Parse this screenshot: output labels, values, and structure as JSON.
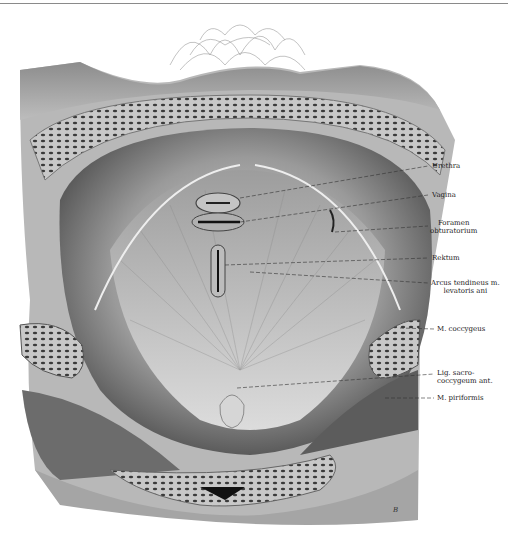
{
  "figure": {
    "labels": [
      {
        "id": "urethra",
        "lines": [
          "Urethra"
        ],
        "x": 432,
        "y": 162
      },
      {
        "id": "vagina",
        "lines": [
          "Vagina"
        ],
        "x": 432,
        "y": 191
      },
      {
        "id": "foramen-obturatorium",
        "lines": [
          "Foramen",
          "obturatorium"
        ],
        "x": 432,
        "y": 219
      },
      {
        "id": "rektum",
        "lines": [
          "Rektum"
        ],
        "x": 432,
        "y": 254
      },
      {
        "id": "arcus-tendineus",
        "lines": [
          "Arcus tendineus m.",
          "levatoris ani"
        ],
        "x": 432,
        "y": 279
      },
      {
        "id": "m-coccygeus",
        "lines": [
          "M. coccygeus"
        ],
        "x": 437,
        "y": 325
      },
      {
        "id": "lig-sacrococcygeum",
        "lines": [
          "Lig. sacro-",
          "coccygeum ant."
        ],
        "x": 437,
        "y": 369
      },
      {
        "id": "m-piriformis",
        "lines": [
          "M. piriformis"
        ],
        "x": 437,
        "y": 394
      }
    ],
    "signature": "B"
  }
}
